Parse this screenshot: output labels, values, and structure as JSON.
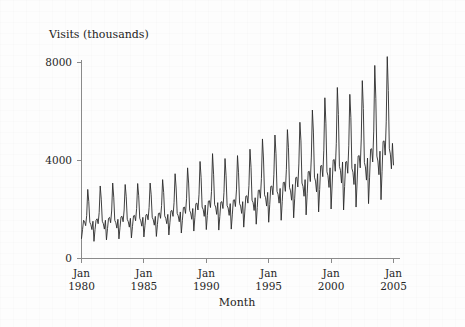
{
  "figure": {
    "background_color": "#fdfdfd",
    "line_color": "#2b2b2b",
    "axis_color": "#8a8a8a",
    "ylabel_text": "Visits (thousands)",
    "xlabel_text": "Month"
  },
  "chart_data": {
    "type": "line",
    "title": "",
    "xlabel": "Month",
    "ylabel": "Visits (thousands)",
    "grid": false,
    "legend": null,
    "ylim": [
      0,
      8600
    ],
    "xlim": [
      "1980-01",
      "2005-01"
    ],
    "ytick_values": [
      0,
      4000,
      8000
    ],
    "ytick_labels": [
      "0",
      "4000",
      "8000"
    ],
    "xtick_labels": [
      "Jan\n1980",
      "Jan\n1985",
      "Jan\n1990",
      "Jan\n1995",
      "Jan\n2000",
      "Jan\n2005"
    ],
    "xtick_label_lines": [
      [
        "Jan",
        "1980"
      ],
      [
        "Jan",
        "1985"
      ],
      [
        "Jan",
        "1990"
      ],
      [
        "Jan",
        "1995"
      ],
      [
        "Jan",
        "2000"
      ],
      [
        "Jan",
        "2005"
      ]
    ],
    "xtick_positions": [
      "1980-01",
      "1985-01",
      "1990-01",
      "1995-01",
      "2000-01",
      "2005-01"
    ],
    "x_start": "1980-01",
    "x_step_months": 1,
    "series": [
      {
        "name": "Visits (thousands)",
        "values": [
          820,
          1180,
          1560,
          1500,
          1340,
          1760,
          2820,
          2320,
          1480,
          1380,
          1180,
          1520,
          700,
          1180,
          1560,
          1620,
          1420,
          1880,
          2960,
          2420,
          1520,
          1420,
          1200,
          1560,
          760,
          1220,
          1640,
          1680,
          1460,
          1940,
          3080,
          2500,
          1560,
          1460,
          1240,
          1600,
          800,
          1260,
          1700,
          1720,
          1500,
          1980,
          3020,
          2520,
          1600,
          1500,
          1280,
          1640,
          840,
          1300,
          1740,
          1760,
          1540,
          2040,
          3060,
          2560,
          1640,
          1540,
          1320,
          1680,
          880,
          1340,
          1780,
          1800,
          1580,
          2080,
          3080,
          2600,
          1680,
          1580,
          1360,
          1720,
          900,
          1380,
          1840,
          1860,
          1640,
          2160,
          3220,
          2700,
          1740,
          1640,
          1420,
          1800,
          960,
          1460,
          1940,
          1960,
          1720,
          2280,
          3460,
          2880,
          1840,
          1740,
          1500,
          1900,
          1040,
          1560,
          2080,
          2100,
          1840,
          2440,
          3700,
          3080,
          1960,
          1860,
          1600,
          2040,
          1120,
          1680,
          2240,
          2260,
          1980,
          2620,
          3960,
          3300,
          2100,
          2000,
          1720,
          2180,
          1180,
          1760,
          2340,
          2360,
          2080,
          2740,
          4280,
          3440,
          2200,
          2100,
          1800,
          2280,
          1160,
          1720,
          2300,
          2320,
          2040,
          2700,
          4080,
          3380,
          2160,
          2060,
          1760,
          2240,
          1200,
          1780,
          2380,
          2400,
          2120,
          2800,
          4200,
          3500,
          2240,
          2140,
          1840,
          2320,
          1280,
          1900,
          2540,
          2560,
          2260,
          2980,
          4460,
          3720,
          2380,
          2280,
          1960,
          2480,
          1400,
          2080,
          2780,
          2800,
          2460,
          3260,
          4880,
          4060,
          2600,
          2480,
          2140,
          2700,
          1480,
          2200,
          2940,
          2960,
          2600,
          3440,
          5040,
          4280,
          2740,
          2620,
          2260,
          2860,
          1560,
          2320,
          3100,
          3120,
          2740,
          3640,
          5260,
          4520,
          2900,
          2760,
          2380,
          3020,
          1660,
          2460,
          3300,
          3320,
          2920,
          3860,
          5560,
          4800,
          3080,
          2940,
          2540,
          3220,
          1780,
          2640,
          3540,
          3560,
          3140,
          4140,
          6060,
          5160,
          3320,
          3160,
          2720,
          3460,
          1900,
          2820,
          3780,
          3800,
          3340,
          4420,
          6560,
          5520,
          3540,
          3380,
          2900,
          3700,
          2020,
          3000,
          4020,
          4040,
          3560,
          4700,
          6980,
          5880,
          3760,
          3600,
          3080,
          3940,
          1980,
          2940,
          3940,
          3960,
          3480,
          4600,
          6700,
          5760,
          3680,
          3520,
          3020,
          3860,
          2100,
          3120,
          4180,
          4200,
          3700,
          4880,
          7260,
          6120,
          3920,
          3740,
          3200,
          4100,
          2240,
          3320,
          4460,
          4480,
          3940,
          5200,
          7880,
          6540,
          4180,
          3980,
          3420,
          4380,
          2400,
          3560,
          4780,
          4800,
          4220,
          5580,
          8240,
          6860,
          4480,
          4260,
          3660,
          4700,
          3820
        ]
      }
    ],
    "annotations": [
      {
        "text": "strong annual seasonality with peak each northern-summer month"
      },
      {
        "text": "upward trend from about 800 thousand in 1980 to about 8200 thousand peak in 2004"
      }
    ]
  }
}
